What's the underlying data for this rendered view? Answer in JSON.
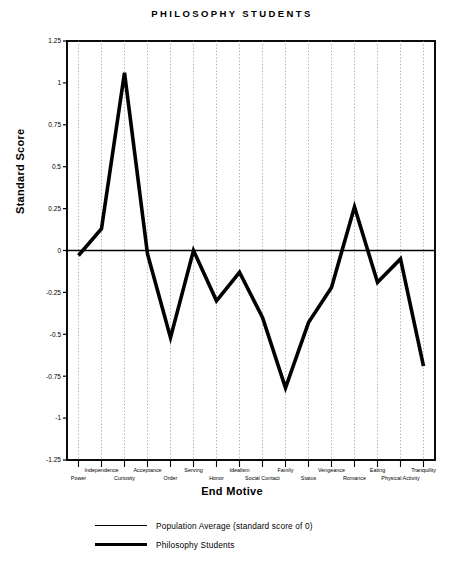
{
  "title": "PHILOSOPHY STUDENTS",
  "axis": {
    "x_title": "End Motive",
    "y_title": "Standard Score"
  },
  "legend": {
    "items": [
      {
        "label": "Population Average (standard score of 0)",
        "style": "thin"
      },
      {
        "label": "Philosophy Students",
        "style": "thick"
      }
    ]
  },
  "chart_data": {
    "type": "line",
    "title": "PHILOSOPHY STUDENTS",
    "xlabel": "End Motive",
    "ylabel": "Standard Score",
    "ylim": [
      -1.25,
      1.25
    ],
    "yticks": [
      1.25,
      1,
      0.75,
      0.5,
      0.25,
      0,
      -0.25,
      -0.5,
      -0.75,
      -1,
      -1.25
    ],
    "ytick_labels": [
      "1.25",
      "1",
      "0.75",
      "0.5",
      "0.25",
      "0",
      "-0.25",
      "-0.5",
      "-0.75",
      "-1",
      "-1.25"
    ],
    "grid": "vertical-dotted",
    "legend_position": "below",
    "categories": [
      "Power",
      "Independence",
      "Curiosity",
      "Acceptance",
      "Order",
      "Serving",
      "Honor",
      "Idealism",
      "Social Contact",
      "Family",
      "Status",
      "Vengeance",
      "Romance",
      "Eating",
      "Physical Activity",
      "Tranquility"
    ],
    "series": [
      {
        "name": "Philosophy Students",
        "style": "thick",
        "values": [
          -0.03,
          0.13,
          1.06,
          -0.02,
          -0.52,
          0.0,
          -0.3,
          -0.13,
          -0.4,
          -0.82,
          -0.43,
          -0.22,
          0.26,
          -0.19,
          -0.05,
          -0.69
        ]
      },
      {
        "name": "Population Average (standard score of 0)",
        "style": "thin",
        "constant": 0
      }
    ]
  }
}
